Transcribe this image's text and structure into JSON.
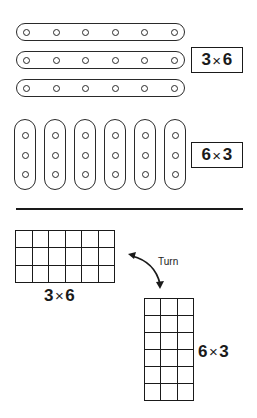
{
  "top": {
    "rows": 3,
    "holes_per_row": 6,
    "label": {
      "a": "3",
      "op": "×",
      "b": "6"
    }
  },
  "middle": {
    "columns": 6,
    "holes_per_column": 3,
    "label": {
      "a": "6",
      "op": "×",
      "b": "3"
    }
  },
  "bottom": {
    "wide_grid": {
      "rows": 3,
      "cols": 6,
      "label": {
        "a": "3",
        "op": "×",
        "b": "6"
      }
    },
    "turn_text": "Turn",
    "tall_grid": {
      "rows": 6,
      "cols": 3,
      "label": {
        "a": "6",
        "op": "×",
        "b": "3"
      }
    }
  },
  "colors": {
    "ink": "#1a1a1a",
    "background": "#ffffff"
  }
}
